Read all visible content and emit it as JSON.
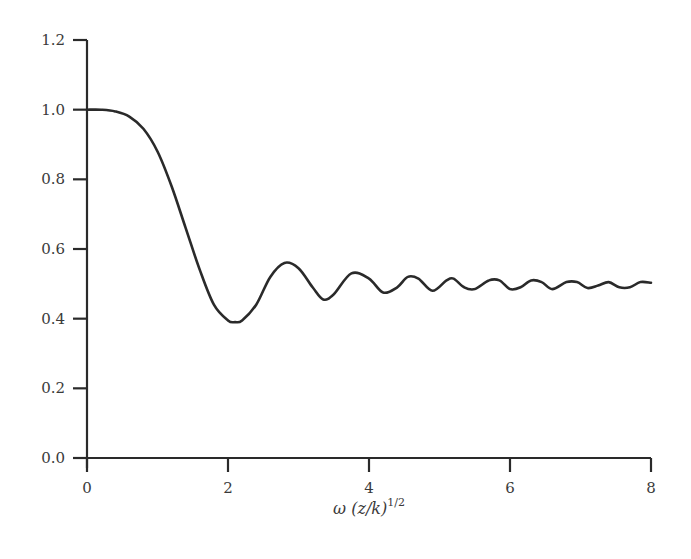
{
  "chart_data": {
    "type": "line",
    "title": "",
    "xlabel": "ω (z/k)^1/2",
    "xlabel_parts": {
      "main": "ω (z/k)",
      "superscript": "1/2"
    },
    "ylabel": "",
    "xlim": [
      0,
      8
    ],
    "ylim": [
      0,
      1.2
    ],
    "x_ticks": [
      0,
      2,
      4,
      6,
      8
    ],
    "x_tick_labels": [
      "0",
      "2",
      "4",
      "6",
      "8"
    ],
    "y_ticks": [
      0.0,
      0.2,
      0.4,
      0.6,
      0.8,
      1.0,
      1.2
    ],
    "y_tick_labels": [
      "0.0",
      "0.2",
      "0.4",
      "0.6",
      "0.8",
      "1.0",
      "1.2"
    ],
    "grid": false,
    "legend": null,
    "line_color": "#2a2a2a",
    "series": [
      {
        "name": "curve",
        "x": [
          0.0,
          0.2,
          0.4,
          0.6,
          0.8,
          1.0,
          1.2,
          1.4,
          1.6,
          1.8,
          2.0,
          2.1,
          2.2,
          2.4,
          2.6,
          2.8,
          3.0,
          3.2,
          3.35,
          3.5,
          3.75,
          4.0,
          4.2,
          4.4,
          4.55,
          4.7,
          4.9,
          5.1,
          5.2,
          5.35,
          5.5,
          5.7,
          5.85,
          6.0,
          6.15,
          6.3,
          6.45,
          6.6,
          6.8,
          6.95,
          7.1,
          7.25,
          7.4,
          7.55,
          7.7,
          7.85,
          8.0
        ],
        "y": [
          1.0,
          1.0,
          0.995,
          0.98,
          0.945,
          0.88,
          0.78,
          0.66,
          0.54,
          0.44,
          0.395,
          0.39,
          0.395,
          0.44,
          0.52,
          0.56,
          0.545,
          0.49,
          0.455,
          0.47,
          0.53,
          0.515,
          0.475,
          0.49,
          0.52,
          0.515,
          0.48,
          0.51,
          0.515,
          0.49,
          0.485,
          0.51,
          0.51,
          0.485,
          0.49,
          0.51,
          0.505,
          0.485,
          0.505,
          0.505,
          0.488,
          0.495,
          0.505,
          0.49,
          0.49,
          0.505,
          0.503
        ]
      }
    ]
  },
  "layout": {
    "plot_left_px": 87,
    "plot_right_px": 651,
    "plot_top_px": 40,
    "plot_bottom_px": 458
  }
}
